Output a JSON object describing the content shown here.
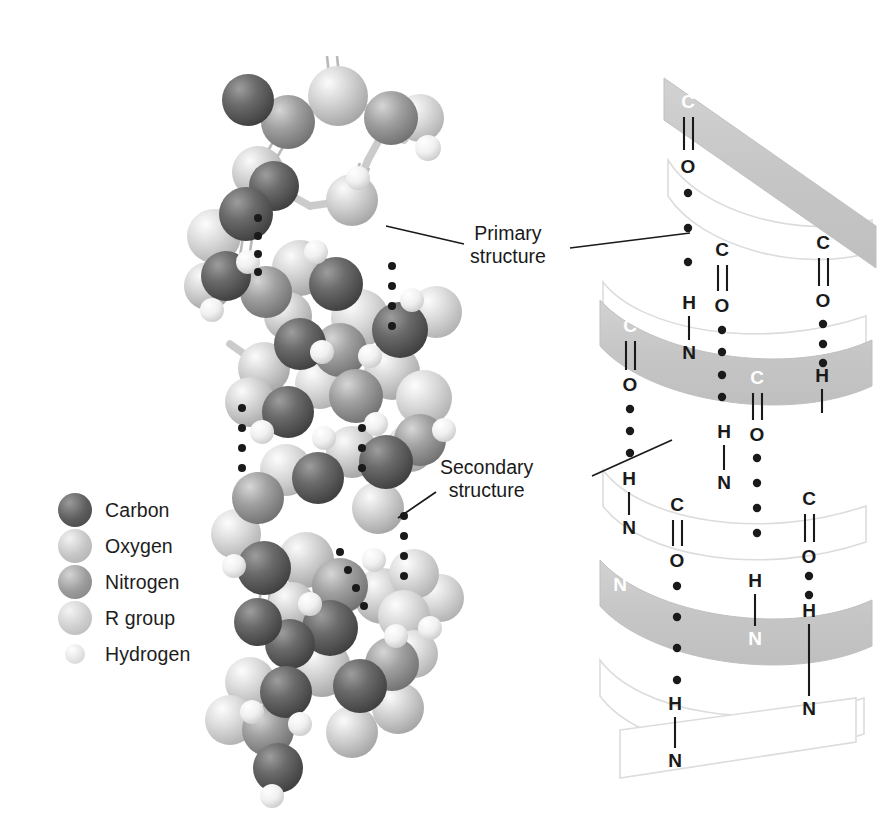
{
  "figure": {
    "domain": "scientific-illustration",
    "background_color": "#ffffff"
  },
  "legend": {
    "title": "Atom key",
    "items": [
      {
        "label": "Carbon",
        "color": "#5d5d5d",
        "highlight": "#9a9a9a",
        "size": "large"
      },
      {
        "label": "Oxygen",
        "color": "#c6c6c6",
        "highlight": "#f2f2f2",
        "size": "large"
      },
      {
        "label": "Nitrogen",
        "color": "#9b9b9b",
        "highlight": "#d4d4d4",
        "size": "large"
      },
      {
        "label": "R group",
        "color": "#cfcfcf",
        "highlight": "#f4f4f4",
        "size": "large"
      },
      {
        "label": "Hydrogen",
        "color": "#e6e6e6",
        "highlight": "#ffffff",
        "size": "small"
      }
    ]
  },
  "annotations": [
    {
      "id": "primary",
      "line1": "Primary",
      "line2": "structure"
    },
    {
      "id": "secondary",
      "line1": "Secondary",
      "line2": "structure"
    }
  ],
  "helix": {
    "ribbon_color": "#c9c9c9",
    "ribbon_edge_color": "#d8d8d8",
    "atoms": [
      {
        "text": "C",
        "x": 688,
        "y": 101,
        "on_ribbon": true
      },
      {
        "text": "O",
        "x": 688,
        "y": 166,
        "on_ribbon": false
      },
      {
        "text": "C",
        "x": 823,
        "y": 242,
        "on_ribbon": false
      },
      {
        "text": "O",
        "x": 823,
        "y": 300,
        "on_ribbon": false
      },
      {
        "text": "C",
        "x": 722,
        "y": 249,
        "on_ribbon": false
      },
      {
        "text": "O",
        "x": 722,
        "y": 305,
        "on_ribbon": false
      },
      {
        "text": "H",
        "x": 689,
        "y": 302,
        "on_ribbon": false
      },
      {
        "text": "N",
        "x": 689,
        "y": 352,
        "on_ribbon": false
      },
      {
        "text": "C",
        "x": 630,
        "y": 325,
        "on_ribbon": true
      },
      {
        "text": "O",
        "x": 630,
        "y": 384,
        "on_ribbon": false
      },
      {
        "text": "C",
        "x": 757,
        "y": 377,
        "on_ribbon": true
      },
      {
        "text": "O",
        "x": 757,
        "y": 434,
        "on_ribbon": false
      },
      {
        "text": "H",
        "x": 822,
        "y": 375,
        "on_ribbon": false
      },
      {
        "text": "N",
        "x": 822,
        "y": 425,
        "on_ribbon": true
      },
      {
        "text": "H",
        "x": 724,
        "y": 431,
        "on_ribbon": false
      },
      {
        "text": "N",
        "x": 724,
        "y": 482,
        "on_ribbon": false
      },
      {
        "text": "H",
        "x": 629,
        "y": 478,
        "on_ribbon": false
      },
      {
        "text": "N",
        "x": 629,
        "y": 527,
        "on_ribbon": false
      },
      {
        "text": "C",
        "x": 677,
        "y": 504,
        "on_ribbon": false
      },
      {
        "text": "O",
        "x": 677,
        "y": 560,
        "on_ribbon": false
      },
      {
        "text": "C",
        "x": 809,
        "y": 498,
        "on_ribbon": false
      },
      {
        "text": "O",
        "x": 809,
        "y": 556,
        "on_ribbon": false
      },
      {
        "text": "N",
        "x": 620,
        "y": 584,
        "on_ribbon": true
      },
      {
        "text": "H",
        "x": 755,
        "y": 580,
        "on_ribbon": false
      },
      {
        "text": "N",
        "x": 755,
        "y": 638,
        "on_ribbon": true
      },
      {
        "text": "H",
        "x": 809,
        "y": 610,
        "on_ribbon": false
      },
      {
        "text": "N",
        "x": 809,
        "y": 708,
        "on_ribbon": false
      },
      {
        "text": "H",
        "x": 675,
        "y": 703,
        "on_ribbon": false
      },
      {
        "text": "N",
        "x": 675,
        "y": 760,
        "on_ribbon": false
      }
    ]
  },
  "molecule": {
    "description": "Ball-and-stick model of a polypeptide chain coiled as an alpha helix",
    "bond_color": "#cccccc",
    "hbond_dot_color": "#1a1a1a"
  }
}
